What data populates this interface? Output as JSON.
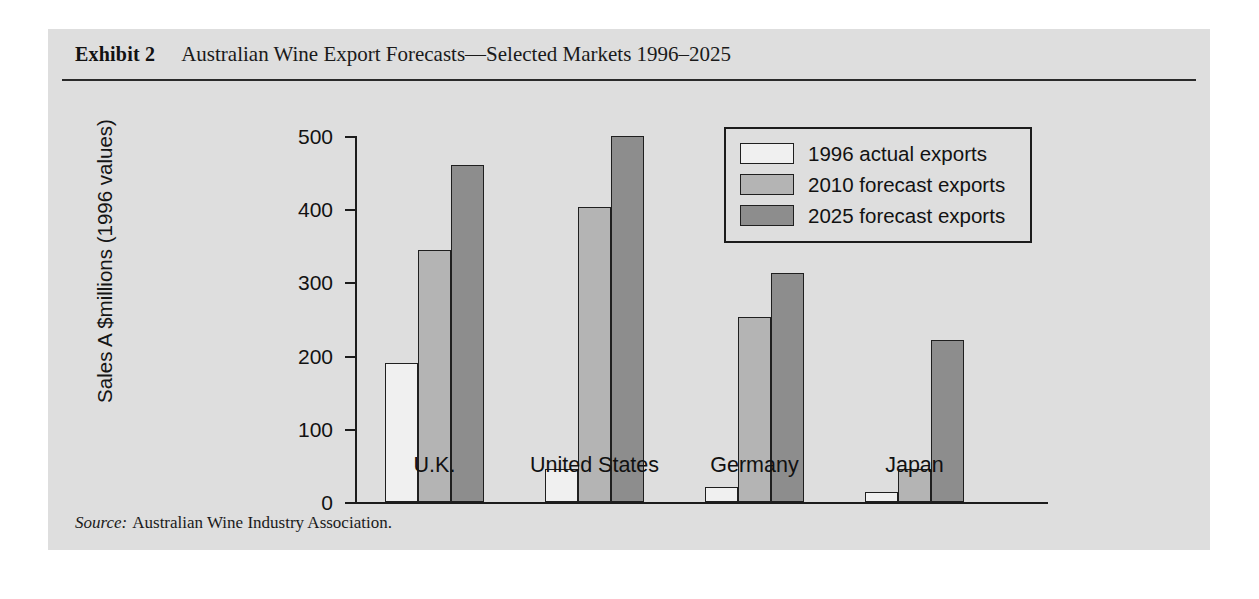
{
  "exhibit": {
    "label": "Exhibit 2",
    "title": "Australian Wine Export Forecasts—Selected Markets 1996–2025",
    "source_prefix": "Source:",
    "source_text": "Australian Wine Industry Association."
  },
  "colors": {
    "panel_background": "#dedede",
    "page_background": "#ffffff",
    "axis": "#1c1c1c",
    "series_1996": "#f0f0f0",
    "series_2010": "#b4b4b4",
    "series_2025": "#8d8d8d",
    "text": "#121212"
  },
  "chart_data": {
    "type": "bar",
    "title": "Australian Wine Export Forecasts—Selected Markets 1996–2025",
    "xlabel": "",
    "ylabel": "Sales A $millions (1996 values)",
    "categories": [
      "U.K.",
      "United States",
      "Germany",
      "Japan"
    ],
    "series": [
      {
        "name": "1996 actual exports",
        "color": "#f0f0f0",
        "values": [
          190,
          45,
          20,
          13
        ]
      },
      {
        "name": "2010 forecast exports",
        "color": "#b4b4b4",
        "values": [
          344,
          403,
          253,
          45
        ]
      },
      {
        "name": "2025 forecast exports",
        "color": "#8d8d8d",
        "values": [
          461,
          500,
          313,
          221
        ]
      }
    ],
    "ylim": [
      0,
      500
    ],
    "yticks": [
      0,
      100,
      200,
      300,
      400,
      500
    ],
    "ytick_labels": [
      "0",
      "100",
      "200",
      "300",
      "400",
      "500"
    ],
    "grid": false,
    "legend_position": "top-right"
  },
  "legend": {
    "entries": [
      {
        "label": "1996 actual exports",
        "swatch": "#f0f0f0"
      },
      {
        "label": "2010 forecast exports",
        "swatch": "#b4b4b4"
      },
      {
        "label": "2025 forecast exports",
        "swatch": "#8d8d8d"
      }
    ]
  }
}
